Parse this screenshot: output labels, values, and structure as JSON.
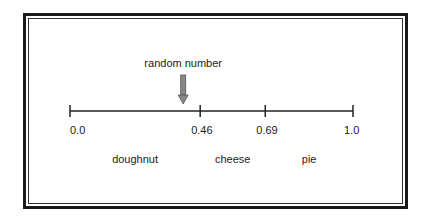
{
  "diagram": {
    "pointer_label": "random number",
    "pointer_value": 0.4,
    "axis": {
      "min": 0.0,
      "max": 1.0,
      "ticks": [
        {
          "value": 0.0,
          "label": "0.0"
        },
        {
          "value": 0.46,
          "label": "0.46"
        },
        {
          "value": 0.69,
          "label": "0.69"
        },
        {
          "value": 1.0,
          "label": "1.0"
        }
      ]
    },
    "segments": [
      {
        "label": "doughnut",
        "from": 0.0,
        "to": 0.46
      },
      {
        "label": "cheese",
        "from": 0.46,
        "to": 0.69
      },
      {
        "label": "pie",
        "from": 0.69,
        "to": 1.0
      }
    ],
    "colors": {
      "line": "#222222",
      "arrow_fill": "#888888",
      "frame": "#1a1a1a"
    }
  }
}
